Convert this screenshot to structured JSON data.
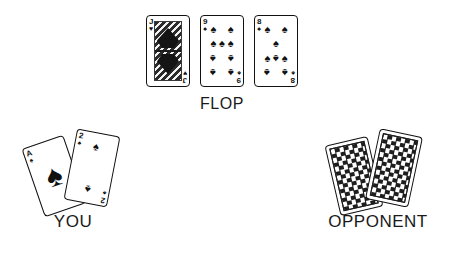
{
  "scene": {
    "background_color": "#ffffff",
    "title": "Texas Hold'em board illustration"
  },
  "flop": {
    "label": "FLOP",
    "cards": [
      {
        "rank": "J",
        "suit": "hearts",
        "suit_symbol": "♥",
        "name": "Jack of Hearts",
        "face_card": true,
        "pip_count": 0
      },
      {
        "rank": "9",
        "suit": "spades",
        "suit_symbol": "♠",
        "name": "Nine of Spades",
        "face_card": false,
        "pip_count": 9
      },
      {
        "rank": "8",
        "suit": "spades",
        "suit_symbol": "♠",
        "name": "Eight of Spades",
        "face_card": false,
        "pip_count": 8
      }
    ]
  },
  "you": {
    "label": "YOU",
    "face_down": false,
    "cards": [
      {
        "rank": "A",
        "suit": "spades",
        "suit_symbol": "♠",
        "name": "Ace of Spades",
        "face_card": false,
        "pip_count": 1
      },
      {
        "rank": "2",
        "suit": "spades",
        "suit_symbol": "♠",
        "name": "Two of Spades",
        "face_card": false,
        "pip_count": 2
      }
    ]
  },
  "opponent": {
    "label": "OPPONENT",
    "face_down": true,
    "card_count": 2,
    "back_pattern": "checkered-diamond",
    "back_color": "#1e1e1e"
  },
  "colors": {
    "ink": "#111111",
    "label_text": "#1a1a1a",
    "card_face": "#ffffff",
    "card_border": "#111111",
    "card_back": "#1e1e1e"
  }
}
